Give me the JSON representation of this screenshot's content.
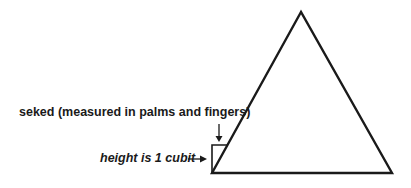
{
  "diagram": {
    "labels": {
      "seked": "seked (measured in palms and fingers)",
      "height": "height is 1 cubit",
      "arrow": "→"
    },
    "colors": {
      "line": "#1a1a1a",
      "background": "#ffffff"
    }
  }
}
